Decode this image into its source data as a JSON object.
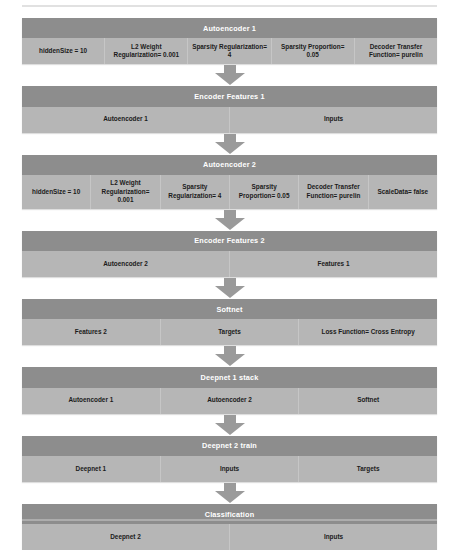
{
  "diagram": {
    "type": "flowchart",
    "orientation": "vertical-top-to-bottom",
    "connector": "down-arrow",
    "colors": {
      "header_band": "#8d8d8d",
      "body_band": "#b6b6b6",
      "divider": "#c6c6c6",
      "arrow": "#9a9a9a",
      "header_text": "#ffffff",
      "cell_text": "#1b1b1b",
      "page_background": "#ffffff"
    },
    "blocks": [
      {
        "title": "Autoencoder 1",
        "cells": [
          "hiddenSize = 10",
          "L2 Weight Regularization= 0.001",
          "Sparsity Regularization= 4",
          "Sparsity Proportion= 0.05",
          "Decoder Transfer Function= purelin"
        ]
      },
      {
        "title": "Encoder Features 1",
        "cells": [
          "Autoencoder 1",
          "Inputs"
        ]
      },
      {
        "title": "Autoencoder 2",
        "cells": [
          "hiddenSize = 10",
          "L2 Weight Regularization= 0.001",
          "Sparsity Regularization= 4",
          "Sparsity Proportion= 0.05",
          "Decoder Transfer Function= purelin",
          "ScaleData= false"
        ]
      },
      {
        "title": "Encoder Features 2",
        "cells": [
          "Autoencoder 2",
          "Features 1"
        ]
      },
      {
        "title": "Softnet",
        "cells": [
          "Features 2",
          "Targets",
          "Loss Function= Cross Entropy"
        ]
      },
      {
        "title": "Deepnet 1 stack",
        "cells": [
          "Autoencoder 1",
          "Autoencoder 2",
          "Softnet"
        ]
      },
      {
        "title": "Deepnet 2 train",
        "cells": [
          "Deepnet 1",
          "Inputs",
          "Targets"
        ]
      },
      {
        "title": "Classification",
        "cells": [
          "Deepnet 2",
          "Inputs"
        ]
      }
    ]
  }
}
